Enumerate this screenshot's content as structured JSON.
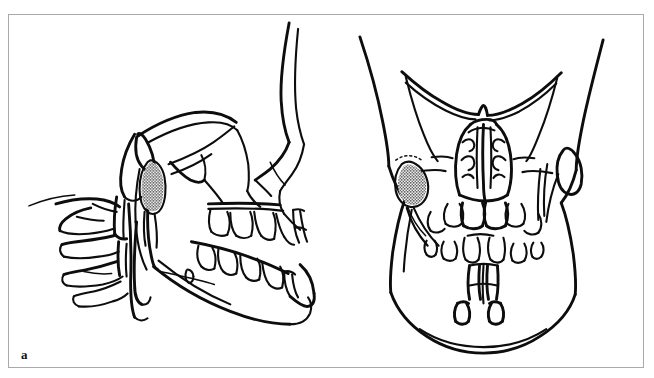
{
  "figure": {
    "panel_label": "a",
    "top_text_remnant": "",
    "frame_color": "#a9a9a9",
    "ink_color": "#0d0d0d",
    "background_color": "#ffffff",
    "caption": "",
    "illustrations": [
      {
        "id": "lateral-skull-view",
        "name": "Lateral (profile) skull line drawing",
        "orientation": "lateral",
        "facing": "right",
        "structures": [
          "cranial base",
          "zygomatic arch",
          "orbital rim",
          "nasal profile",
          "maxilla with dentition",
          "mandible with dentition",
          "mandibular ramus",
          "mandibular condyle",
          "coronoid process",
          "cervical vertebrae"
        ],
        "lesion": {
          "name": "stippled lesion at mandibular condyle / ramus",
          "pattern": "stipple",
          "fill_color": "#0d0d0d"
        }
      },
      {
        "id": "frontal-skull-view",
        "name": "Frontal (anteroposterior) skull line drawing",
        "orientation": "frontal",
        "facing": "viewer",
        "structures": [
          "supraorbital ridges",
          "orbital rims",
          "nasal cavity and turbinates",
          "nasal septum",
          "zygomatic arches",
          "maxillary dentition",
          "mandibular dentition",
          "mandibular body",
          "mandibular rami",
          "mandibular condyles"
        ],
        "lesion": {
          "name": "stippled lesion at left mandibular condyle region",
          "pattern": "stipple",
          "fill_color": "#0d0d0d"
        }
      }
    ]
  }
}
